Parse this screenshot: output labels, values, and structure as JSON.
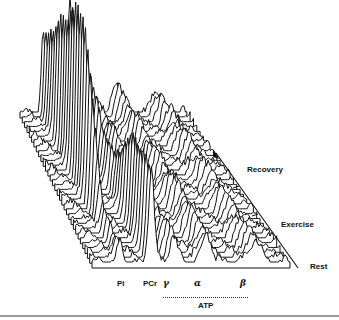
{
  "chart_data": {
    "type": "waterfall",
    "title": "",
    "x_peaks": [
      "Pi",
      "PCr",
      "γ",
      "α",
      "β"
    ],
    "x_group_label": "ATP",
    "x_group_members": [
      "γ",
      "α",
      "β"
    ],
    "time_axis": {
      "labels": [
        "Rest",
        "Exercise",
        "Recovery"
      ],
      "direction": "arrow pointing toward Recovery (back)"
    },
    "n_traces": 32,
    "series_relative_heights": {
      "Pi": {
        "rest": 0.25,
        "exercise_peak": 1.0,
        "recovery_end": 0.35
      },
      "PCr": {
        "rest": 0.9,
        "exercise_min": 0.35,
        "recovery_end": 0.75
      },
      "ATP_gamma": 0.3,
      "ATP_alpha": 0.3,
      "ATP_beta": 0.25
    }
  },
  "labels": {
    "pi": "Pi",
    "pcr": "PCr",
    "gamma": "γ",
    "alpha": "α",
    "beta": "β",
    "atp": "ATP",
    "recovery": "Recovery",
    "exercise": "Exercise",
    "rest": "Rest"
  },
  "colors": {
    "ink": "#111111",
    "background": "#ffffff",
    "rule": "#9a9a9a"
  }
}
